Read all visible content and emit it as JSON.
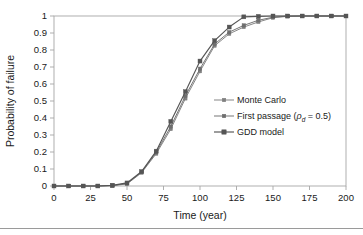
{
  "figure": {
    "background_color": "#ffffff",
    "axis_color": "#a6a6a6",
    "text_color": "#1a1a1a"
  },
  "chart_data": {
    "type": "line",
    "title": "",
    "xlabel": "Time (year)",
    "ylabel": "Probability of failure",
    "xlim": [
      0,
      200
    ],
    "ylim": [
      0,
      1
    ],
    "xticks": [
      0,
      25,
      50,
      75,
      100,
      125,
      150,
      175,
      200
    ],
    "xtick_labels": [
      "0",
      "25",
      "50",
      "75",
      "100",
      "125",
      "150",
      "175",
      "200"
    ],
    "yticks": [
      0,
      0.1,
      0.2,
      0.3,
      0.4,
      0.5,
      0.6,
      0.7,
      0.8,
      0.9,
      1
    ],
    "ytick_labels": [
      "0",
      "0.1",
      "0.2",
      "0.3",
      "0.4",
      "0.5",
      "0.6",
      "0.7",
      "0.8",
      "0.9",
      "1"
    ],
    "grid": false,
    "legend_position": "center-right",
    "x": [
      0,
      10,
      20,
      30,
      40,
      50,
      60,
      70,
      80,
      90,
      100,
      110,
      120,
      130,
      140,
      150,
      160,
      170,
      180,
      190,
      200
    ],
    "series": [
      {
        "name": "Monte Carlo",
        "color": "#808080",
        "marker": "square",
        "values": [
          0,
          0,
          0,
          0,
          0.002,
          0.012,
          0.078,
          0.19,
          0.335,
          0.515,
          0.675,
          0.825,
          0.895,
          0.935,
          0.965,
          0.99,
          0.998,
          1,
          1,
          1,
          1
        ]
      },
      {
        "name": "First passage (ρ_d = 0.5)",
        "label_prefix": "First passage (",
        "label_symbol": "ρ",
        "label_subscript": "d",
        "label_suffix": " = 0.5)",
        "color": "#6e6e6e",
        "marker": "square",
        "values": [
          0,
          0,
          0,
          0,
          0.003,
          0.015,
          0.082,
          0.198,
          0.35,
          0.53,
          0.69,
          0.835,
          0.905,
          0.945,
          0.975,
          0.993,
          0.999,
          1,
          1,
          1,
          1
        ]
      },
      {
        "name": "GDD model",
        "color": "#555555",
        "marker": "square-filled",
        "values": [
          0,
          0,
          0,
          0,
          0.004,
          0.018,
          0.085,
          0.205,
          0.38,
          0.555,
          0.735,
          0.855,
          0.935,
          0.995,
          0.998,
          1,
          1,
          1,
          1,
          1,
          1
        ]
      }
    ]
  }
}
